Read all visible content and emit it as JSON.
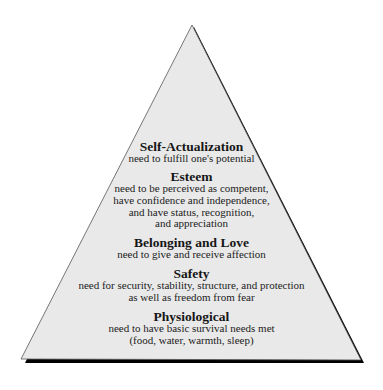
{
  "diagram": {
    "type": "pyramid",
    "colors": {
      "fill": "#e9e9e9",
      "outline": "#444444",
      "shadow": "#000000",
      "text": "#1a1a1a"
    },
    "levels": [
      {
        "title": "Self-Actualization",
        "description_lines": [
          "need to fulfill one's potential"
        ]
      },
      {
        "title": "Esteem",
        "description_lines": [
          "need to be perceived as competent,",
          "have confidence and independence,",
          "and have status, recognition,",
          "and appreciation"
        ]
      },
      {
        "title": "Belonging and Love",
        "description_lines": [
          "need to give and receive affection"
        ]
      },
      {
        "title": "Safety",
        "description_lines": [
          "need for security, stability, structure, and protection",
          "as well as freedom from fear"
        ]
      },
      {
        "title": "Physiological",
        "description_lines": [
          "need to have basic survival needs met",
          "(food, water, warmth, sleep)"
        ]
      }
    ]
  }
}
